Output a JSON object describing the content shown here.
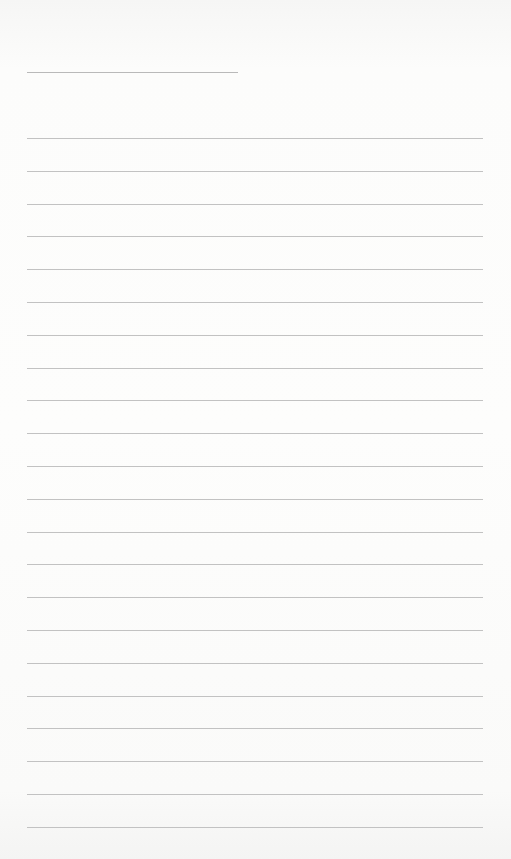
{
  "document": {
    "type": "lined-paper",
    "background_color": "#fbfbfa",
    "line_color": "#c2c2c2",
    "title_line": {
      "text": ""
    },
    "ruled_lines": [
      {
        "text": ""
      },
      {
        "text": ""
      },
      {
        "text": ""
      },
      {
        "text": ""
      },
      {
        "text": ""
      },
      {
        "text": ""
      },
      {
        "text": ""
      },
      {
        "text": ""
      },
      {
        "text": ""
      },
      {
        "text": ""
      },
      {
        "text": ""
      },
      {
        "text": ""
      },
      {
        "text": ""
      },
      {
        "text": ""
      },
      {
        "text": ""
      },
      {
        "text": ""
      },
      {
        "text": ""
      },
      {
        "text": ""
      },
      {
        "text": ""
      },
      {
        "text": ""
      },
      {
        "text": ""
      },
      {
        "text": ""
      }
    ]
  }
}
